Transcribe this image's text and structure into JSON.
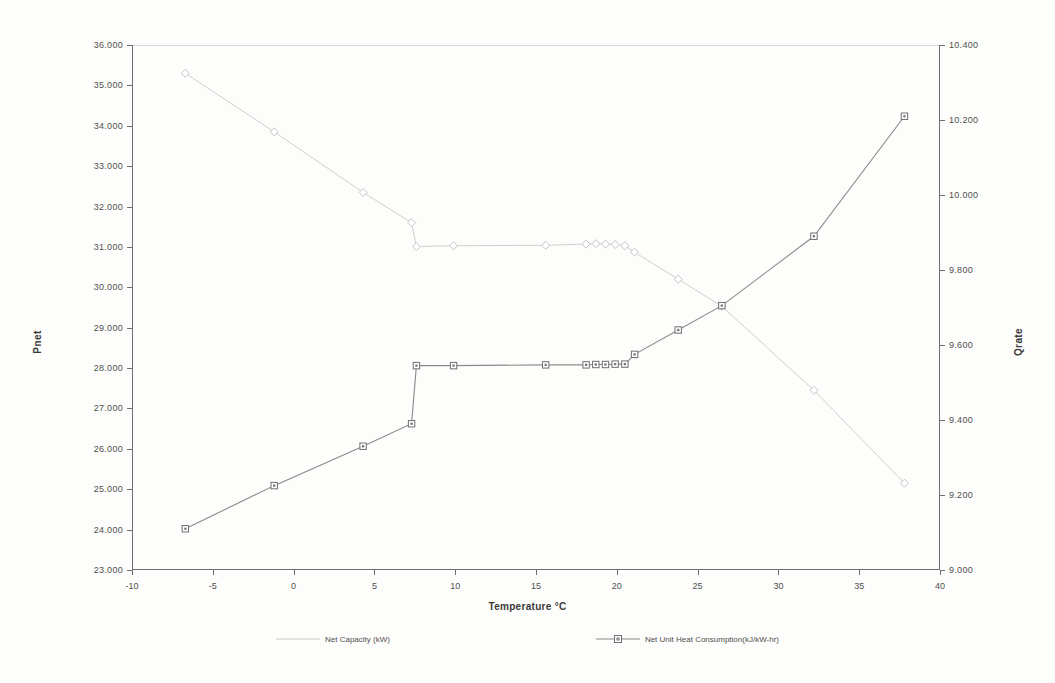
{
  "chart_data": {
    "type": "line",
    "title": "",
    "xlabel": "Temperature °C",
    "ylabel": "Pnet",
    "y2label": "Qrate",
    "xlim": [
      -10,
      40
    ],
    "ylim": [
      23.0,
      36.0
    ],
    "y2lim": [
      9.0,
      10.4
    ],
    "grid": false,
    "legend_position": "bottom",
    "x_ticks": [
      "-10",
      "-5",
      "0",
      "5",
      "10",
      "15",
      "20",
      "25",
      "30",
      "35",
      "40"
    ],
    "x_tick_values": [
      -10,
      -5,
      0,
      5,
      10,
      15,
      20,
      25,
      30,
      35,
      40
    ],
    "y_ticks": [
      "23.000",
      "24.000",
      "25.000",
      "26.000",
      "27.000",
      "28.000",
      "29.000",
      "30.000",
      "31.000",
      "32.000",
      "33.000",
      "34.000",
      "35.000",
      "36.000"
    ],
    "y_tick_values": [
      23.0,
      24.0,
      25.0,
      26.0,
      27.0,
      28.0,
      29.0,
      30.0,
      31.0,
      32.0,
      33.0,
      34.0,
      35.0,
      36.0
    ],
    "y2_ticks": [
      "9.000",
      "9.200",
      "9.400",
      "9.600",
      "9.800",
      "10.000",
      "10.200",
      "10.400"
    ],
    "y2_tick_values": [
      9.0,
      9.2,
      9.4,
      9.6,
      9.8,
      10.0,
      10.2,
      10.4
    ],
    "series": [
      {
        "name": "Net Capacity (kW)",
        "axis": "left",
        "color": "#c9c9c9",
        "marker": "diamond",
        "marker_color": "#bdbdbd",
        "x": [
          -6.7,
          -1.2,
          4.3,
          7.3,
          7.6,
          9.9,
          15.6,
          18.1,
          18.7,
          19.3,
          19.9,
          20.5,
          21.1,
          23.8,
          26.5,
          32.2,
          37.8
        ],
        "y": [
          35.3,
          33.85,
          32.35,
          31.6,
          31.01,
          31.03,
          31.04,
          31.07,
          31.08,
          31.07,
          31.06,
          31.03,
          30.87,
          30.2,
          29.53,
          27.45,
          25.15
        ]
      },
      {
        "name": "Net Unit Heat Consumption(kJ/kW-hr)",
        "axis": "right",
        "color": "#8a8a8a",
        "marker": "square",
        "marker_color": "#6f6f6f",
        "x": [
          -6.7,
          -1.2,
          4.3,
          7.3,
          7.6,
          9.9,
          15.6,
          18.1,
          18.7,
          19.3,
          19.9,
          20.5,
          21.1,
          23.8,
          26.5,
          32.2,
          37.8
        ],
        "y": [
          9.11,
          9.225,
          9.33,
          9.39,
          9.545,
          9.545,
          9.547,
          9.547,
          9.548,
          9.548,
          9.549,
          9.549,
          9.575,
          9.64,
          9.705,
          9.89,
          10.21
        ]
      }
    ]
  },
  "legend": {
    "entries": [
      {
        "label": "Net Capacity (kW)"
      },
      {
        "label": "Net Unit Heat Consumption(kJ/kW-hr)"
      }
    ]
  }
}
